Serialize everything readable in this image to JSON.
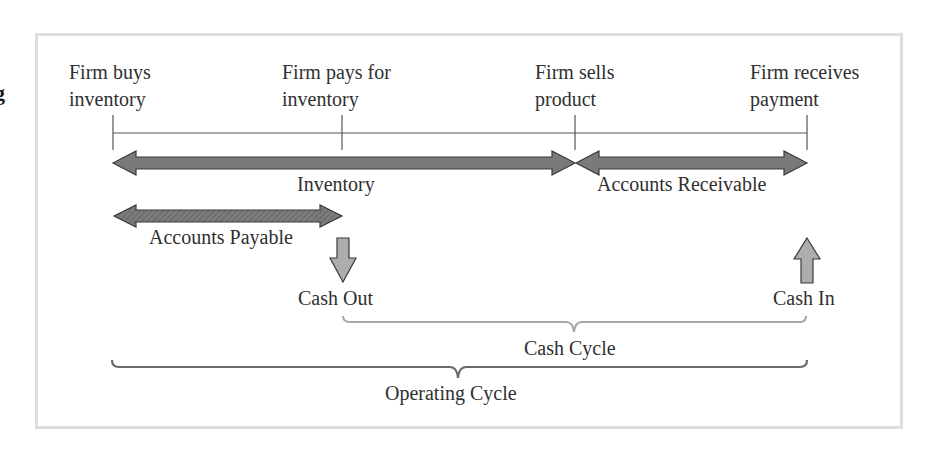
{
  "clipped_text": "g",
  "events": [
    {
      "line1": "Firm buys",
      "line2": "inventory",
      "x": 113
    },
    {
      "line1": "Firm pays for",
      "line2": "inventory",
      "x": 342
    },
    {
      "line1": "Firm sells",
      "line2": "product",
      "x": 575
    },
    {
      "line1": "Firm receives",
      "line2": "payment",
      "x": 807
    }
  ],
  "periods": {
    "inventory": "Inventory",
    "accounts_receivable": "Accounts Receivable",
    "accounts_payable": "Accounts Payable"
  },
  "cash_flows": {
    "cash_out": "Cash Out",
    "cash_in": "Cash In"
  },
  "cycles": {
    "cash_cycle": "Cash Cycle",
    "operating_cycle": "Operating Cycle"
  },
  "colors": {
    "text": "#2f2f2f",
    "timeline": "#555555",
    "period_arrow_fill": "#7a7a7a",
    "period_arrow_stroke": "#3a3a3a",
    "cash_arrow_fill": "#adadad",
    "cash_cycle_brace": "#a6a6a6",
    "operating_cycle_brace": "#6a6a6a",
    "frame": "#dedede"
  }
}
